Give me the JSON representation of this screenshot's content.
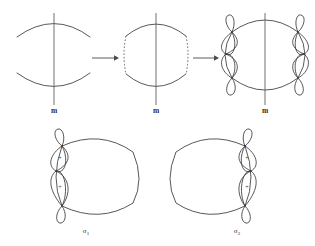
{
  "figure": {
    "background_color": "#ffffff",
    "stroke_color": "#3a3a3a",
    "width": 315,
    "height": 246
  },
  "top_row": {
    "panels": [
      {
        "id": "panel-1",
        "label": "m",
        "description": "two open arcs with vertical mirror line",
        "side_style": "open"
      },
      {
        "id": "panel-2",
        "label": "m",
        "description": "closed curve with dashed vertical sides and vertical mirror line",
        "side_style": "dashed"
      },
      {
        "id": "panel-3",
        "label": "m",
        "description": "closed curve with loop chains on both sides and vertical mirror line",
        "side_style": "loops"
      }
    ],
    "arrows": [
      {
        "id": "arrow-1",
        "glyph": "→"
      },
      {
        "id": "arrow-2",
        "glyph": "→"
      }
    ]
  },
  "bottom_row": {
    "panels": [
      {
        "id": "sigma-1",
        "label": "σ",
        "subscript": "1",
        "loop_side": "left",
        "loop_signs": [
          "+",
          "+"
        ],
        "description": "closed curve with loop chain on the left side, two plus-marked loops"
      },
      {
        "id": "sigma-2",
        "label": "σ",
        "subscript": "2",
        "loop_side": "right",
        "loop_signs": [
          "+",
          "+"
        ],
        "description": "closed curve with loop chain on the right side, two plus-marked loops"
      }
    ]
  }
}
